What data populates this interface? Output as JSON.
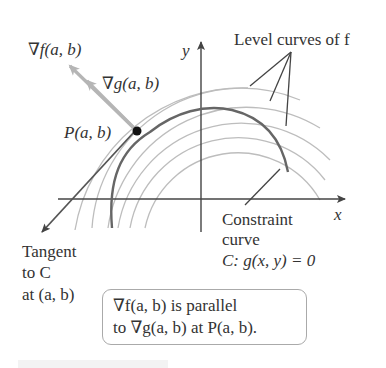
{
  "figure": {
    "labels": {
      "grad_f": "∇f(a, b)",
      "grad_g": "∇g(a, b)",
      "point_p": "P(a, b)",
      "y_axis": "y",
      "x_axis": "x",
      "level_curves": "Level curves of f",
      "constraint_line1": "Constraint",
      "constraint_line2": "curve",
      "constraint_eq": "C: g(x, y) = 0",
      "tangent_line1": "Tangent",
      "tangent_line2": "to C",
      "tangent_line3": "at (a, b)"
    },
    "note": {
      "line1": "∇f(a, b) is parallel",
      "line2": "to ∇g(a, b) at P(a, b)."
    },
    "colors": {
      "level_curve": "#bdbdbd",
      "constraint_curve": "#666666",
      "axes": "#444444",
      "gradient_arrows": "#b5b5b5",
      "tangent": "#555555",
      "point": "#111111",
      "text": "#333333"
    }
  }
}
